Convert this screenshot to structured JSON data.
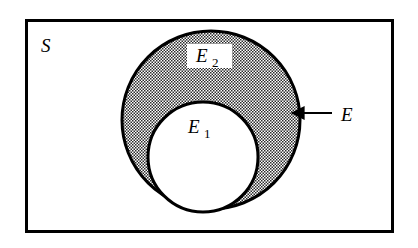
{
  "figure": {
    "kind": "venn-diagram",
    "background_color": "#ffffff",
    "ink_color": "#000000",
    "shading_color": "#808080",
    "shading_style": "checkerboard-dither"
  },
  "universe": {
    "label": "S",
    "rect": {
      "x": 25,
      "y": 19,
      "width": 369,
      "height": 214
    },
    "stroke_width": 3,
    "label_position": {
      "x": 41,
      "y": 52
    },
    "label_font_size": 19
  },
  "outer_set": {
    "label": "E",
    "sub": "2",
    "center": {
      "x": 211,
      "y": 120
    },
    "radius": 89,
    "stroke_width": 3,
    "filled": true,
    "label_position": {
      "x": 204,
      "y": 62
    },
    "label_font_size": 19,
    "sub_font_size": 13,
    "label_has_white_background": true,
    "label_box": {
      "x": 187,
      "y": 44,
      "width": 45,
      "height": 24
    }
  },
  "inner_set": {
    "label": "E",
    "sub": "1",
    "center": {
      "x": 203,
      "y": 157
    },
    "radius": 55,
    "stroke_width": 3,
    "filled": false,
    "label_position": {
      "x": 196,
      "y": 133
    },
    "label_font_size": 19,
    "sub_font_size": 13,
    "label_has_white_background": false
  },
  "callout": {
    "label": "E",
    "label_position": {
      "x": 341,
      "y": 121
    },
    "label_font_size": 19,
    "line": {
      "x1": 332,
      "y1": 113,
      "x2": 292,
      "y2": 113
    },
    "stroke_width": 2,
    "arrow_tip": {
      "x": 288,
      "y": 113
    },
    "arrow_head_size": 9,
    "points_to": "shaded-annulus-region"
  }
}
